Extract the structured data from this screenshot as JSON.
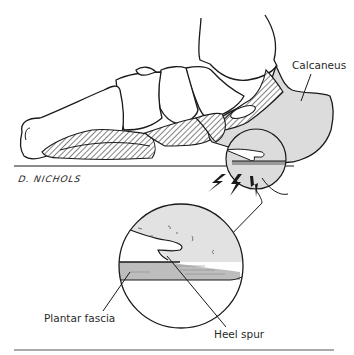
{
  "figure": {
    "labels": {
      "calcaneus": "Calcaneus",
      "plantar_fascia": "Plantar fascia",
      "heel_spur": "Heel spur"
    },
    "signature": "D. NICHOLS",
    "colors": {
      "bone_fill": "#ffffff",
      "calcaneus_fill": "#dcdcdc",
      "fascia_fill": "#bdbdbd",
      "outline": "#1a1a1a"
    },
    "elements": [
      "foot-skeleton-lateral-view",
      "calcaneus-shaded",
      "magnified-circle-inset",
      "pain-lightning-bolts",
      "heel-spur",
      "plantar-fascia"
    ]
  }
}
